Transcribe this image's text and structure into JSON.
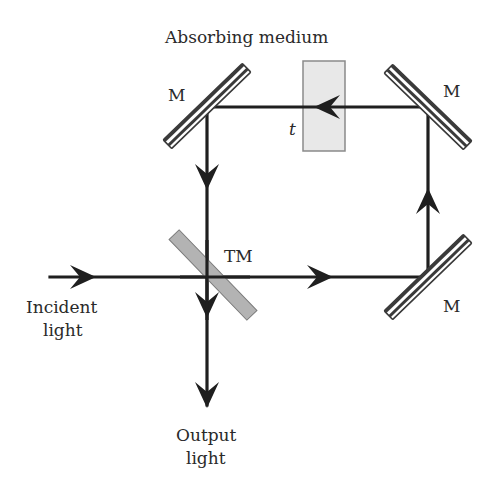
{
  "title": "Absorbing medium",
  "labels": {
    "mirror_top_left": "M",
    "mirror_top_right": "M",
    "mirror_bottom_right": "M",
    "beam_splitter": "TM",
    "thickness": "t",
    "incident_line1": "Incident",
    "incident_line2": "light",
    "output_line1": "Output",
    "output_line2": "light"
  },
  "colors": {
    "beam": "#1f1f1f",
    "mirror_hatch": "#3a3a3a",
    "beam_splitter": "#b3b3b3",
    "medium_fill": "#e8e8e8",
    "medium_stroke": "#8a8a8a"
  }
}
